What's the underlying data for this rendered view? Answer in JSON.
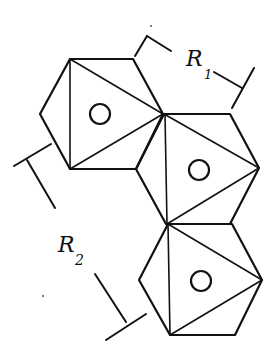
{
  "diagram": {
    "labels": {
      "r1_main": "R",
      "r1_sub": "1",
      "r2_main": "R",
      "r2_sub": "2"
    },
    "hexagons": [
      {
        "id": "hex-1",
        "center_marker": "circle"
      },
      {
        "id": "hex-2",
        "center_marker": "circle"
      },
      {
        "id": "hex-3",
        "center_marker": "circle"
      }
    ],
    "dimensions": [
      {
        "name": "R1",
        "between": "hexagon 1 top edge and hexagon 2 top edge"
      },
      {
        "name": "R2",
        "between": "hexagon 1 bottom-left and hexagon 3 bottom-left"
      }
    ],
    "colors": {
      "ink": "#111111",
      "paper": "#ffffff"
    }
  }
}
